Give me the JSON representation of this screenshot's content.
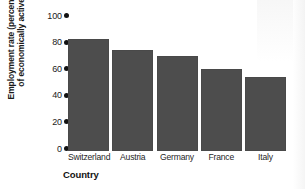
{
  "chart_data": {
    "type": "bar",
    "title": "",
    "categories": [
      "Switzerland",
      "Austria",
      "Germany",
      "France",
      "Italy"
    ],
    "values": [
      82,
      74,
      69,
      60,
      54
    ],
    "xlabel": "Country",
    "ylabel": "Employment rate (percentage of economically active)",
    "ylabel_line1": "Employment rate (percentage",
    "ylabel_line2": "of economically active)",
    "ylim": [
      0,
      100
    ],
    "yticks": [
      100,
      80,
      60,
      40,
      20,
      0
    ],
    "ytick_labels": [
      "100",
      "80",
      "60",
      "40",
      "20",
      "0"
    ],
    "grid": false,
    "legend": null,
    "bar_color": "#4d4d4d",
    "axis_text_color": "#1a1a1a",
    "background_color": "#ffffff",
    "tick_marker": "filled-dot"
  }
}
